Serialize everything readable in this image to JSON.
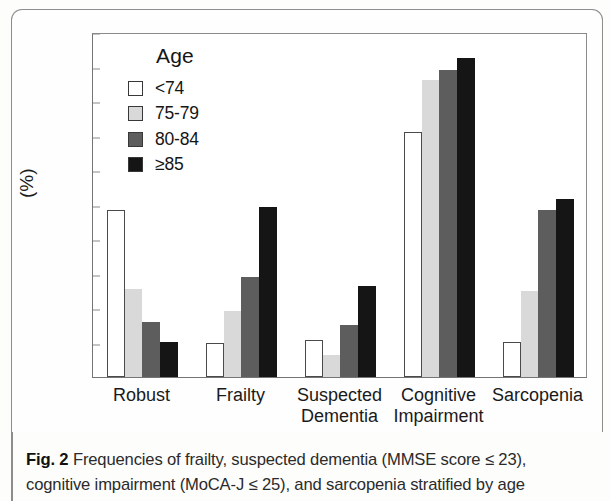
{
  "figure": {
    "caption_label": "Fig. 2",
    "caption_text": " Frequencies of frailty, suspected dementia (MMSE score ≤ 23), cognitive impairment (MoCA-J ≤ 25), and sarcopenia stratified by age"
  },
  "legend": {
    "title": "Age",
    "entries": [
      {
        "label": "<74",
        "color": "#ffffff"
      },
      {
        "label": "75-79",
        "color": "#d9d9d9"
      },
      {
        "label": "80-84",
        "color": "#5d5d5d"
      },
      {
        "label": "≥85",
        "color": "#151515"
      }
    ]
  },
  "chart_data": {
    "type": "bar",
    "title": "",
    "xlabel": "",
    "ylabel": "(%)",
    "ylim": [
      0,
      100
    ],
    "yticks": [
      0,
      10,
      20,
      30,
      40,
      50,
      60,
      70,
      80,
      90,
      100
    ],
    "ytick_labels": [
      "0",
      "10",
      "20",
      "30",
      "40",
      "50",
      "60",
      "70",
      "80",
      "90",
      "100"
    ],
    "grid": false,
    "legend_position": "upper-left-inside",
    "categories": [
      "Robust",
      "Frailty",
      "Suspected\nDementia",
      "Cognitive\nImpairment",
      "Sarcopenia"
    ],
    "series": [
      {
        "name": "<74",
        "color": "#ffffff",
        "values": [
          48.5,
          10.0,
          10.8,
          71.0,
          10.2
        ]
      },
      {
        "name": "75-79",
        "color": "#d9d9d9",
        "values": [
          25.5,
          19.0,
          6.5,
          86.0,
          25.0
        ]
      },
      {
        "name": "80-84",
        "color": "#5d5d5d",
        "values": [
          16.0,
          29.0,
          15.2,
          89.0,
          48.5
        ]
      },
      {
        "name": "≥85",
        "color": "#151515",
        "values": [
          10.2,
          49.3,
          26.5,
          92.5,
          51.5
        ]
      }
    ]
  }
}
